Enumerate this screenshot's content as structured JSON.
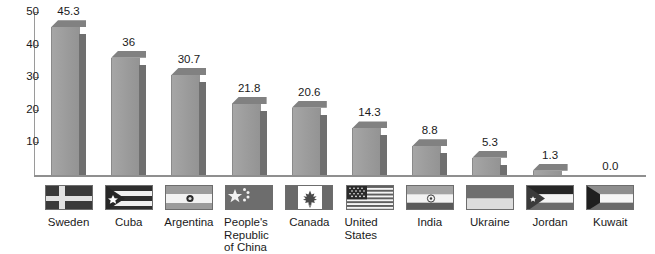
{
  "chart_data": {
    "type": "bar",
    "title": "",
    "subtitle": "",
    "xlabel": "",
    "ylabel": "",
    "ylim": [
      0,
      50
    ],
    "yticks": [
      10,
      20,
      30,
      40,
      50
    ],
    "grid": false,
    "legend": null,
    "categories": [
      "Sweden",
      "Cuba",
      "Argentina",
      "People's Republic of China",
      "Canada",
      "United States",
      "India",
      "Ukraine",
      "Jordan",
      "Kuwait"
    ],
    "values": [
      45.3,
      36,
      30.7,
      21.8,
      20.6,
      14.3,
      8.8,
      5.3,
      1.3,
      0.0
    ],
    "value_labels": [
      "45.3",
      "36",
      "30.7",
      "21.8",
      "20.6",
      "14.3",
      "8.8",
      "5.3",
      "1.3",
      "0.0"
    ],
    "bars": [
      {
        "category": "Sweden",
        "label_lines": [
          "Sweden"
        ],
        "value": 45.3,
        "value_label": "45.3",
        "flag": "sweden-flag"
      },
      {
        "category": "Cuba",
        "label_lines": [
          "Cuba"
        ],
        "value": 36,
        "value_label": "36",
        "flag": "cuba-flag"
      },
      {
        "category": "Argentina",
        "label_lines": [
          "Argentina"
        ],
        "value": 30.7,
        "value_label": "30.7",
        "flag": "argentina-flag"
      },
      {
        "category": "People's Republic of China",
        "label_lines": [
          "People's",
          "Republic",
          "of China"
        ],
        "value": 21.8,
        "value_label": "21.8",
        "flag": "china-flag"
      },
      {
        "category": "Canada",
        "label_lines": [
          "Canada"
        ],
        "value": 20.6,
        "value_label": "20.6",
        "flag": "canada-flag"
      },
      {
        "category": "United States",
        "label_lines": [
          "United",
          "States"
        ],
        "value": 14.3,
        "value_label": "14.3",
        "flag": "united-states-flag"
      },
      {
        "category": "India",
        "label_lines": [
          "India"
        ],
        "value": 8.8,
        "value_label": "8.8",
        "flag": "india-flag"
      },
      {
        "category": "Ukraine",
        "label_lines": [
          "Ukraine"
        ],
        "value": 5.3,
        "value_label": "5.3",
        "flag": "ukraine-flag"
      },
      {
        "category": "Jordan",
        "label_lines": [
          "Jordan"
        ],
        "value": 1.3,
        "value_label": "1.3",
        "flag": "jordan-flag"
      },
      {
        "category": "Kuwait",
        "label_lines": [
          "Kuwait"
        ],
        "value": 0.0,
        "value_label": "0.0",
        "flag": "kuwait-flag"
      }
    ]
  },
  "colors": {
    "bar_front": "#9d9d9d",
    "bar_side": "#6f6f6f",
    "bar_top": "#818181",
    "axis": "#8f8f8f",
    "text": "#1a1a1a",
    "background": "#ffffff"
  }
}
